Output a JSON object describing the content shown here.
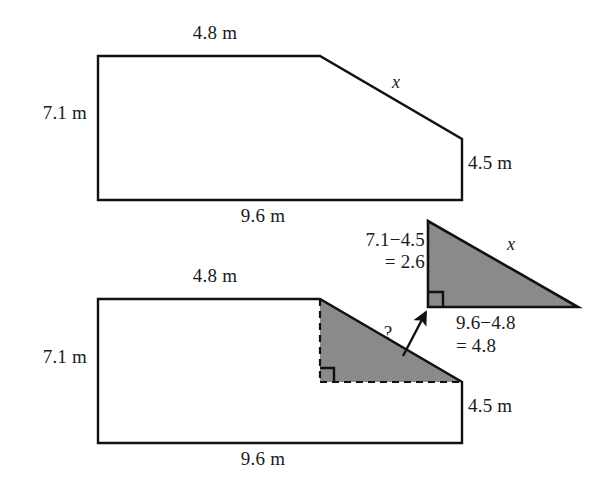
{
  "diagram": {
    "units": "m",
    "colors": {
      "stroke": "#111111",
      "shade_fill": "#8a8a8a",
      "background": "#ffffff",
      "text": "#1a1a1a"
    },
    "top_figure": {
      "name": "original-composite-shape",
      "labels": {
        "top_side": "4.8 m",
        "left_side": "7.1 m",
        "bottom_side": "9.6 m",
        "right_side": "4.5 m",
        "hypotenuse": "x"
      },
      "vertices": [
        {
          "x": 98,
          "y": 56
        },
        {
          "x": 320,
          "y": 56
        },
        {
          "x": 462,
          "y": 139
        },
        {
          "x": 462,
          "y": 200
        },
        {
          "x": 98,
          "y": 200
        }
      ]
    },
    "bottom_figure": {
      "name": "decomposed-composite-shape",
      "labels": {
        "top_side": "4.8 m",
        "left_side": "7.1 m",
        "bottom_side": "9.6 m",
        "right_side": "4.5 m",
        "unknown_marker": "?"
      },
      "vertices": [
        {
          "x": 98,
          "y": 299
        },
        {
          "x": 320,
          "y": 299
        },
        {
          "x": 462,
          "y": 382
        },
        {
          "x": 462,
          "y": 443
        },
        {
          "x": 98,
          "y": 443
        }
      ],
      "shaded_triangle": [
        {
          "x": 320,
          "y": 299
        },
        {
          "x": 462,
          "y": 382
        },
        {
          "x": 320,
          "y": 382
        }
      ]
    },
    "extracted_triangle": {
      "name": "extracted-right-triangle",
      "labels": {
        "vertical_leg": "7.1−4.5",
        "vertical_leg_result": "= 2.6",
        "horizontal_leg": "9.6−4.8",
        "horizontal_leg_result": "= 4.8",
        "hypotenuse": "x"
      },
      "vertices": [
        {
          "x": 428,
          "y": 221
        },
        {
          "x": 428,
          "y": 307
        },
        {
          "x": 578,
          "y": 307
        }
      ]
    },
    "callout_arrow": {
      "name": "extraction-arrow",
      "from": {
        "x": 404,
        "y": 355
      },
      "to": {
        "x": 427,
        "y": 311
      }
    }
  }
}
